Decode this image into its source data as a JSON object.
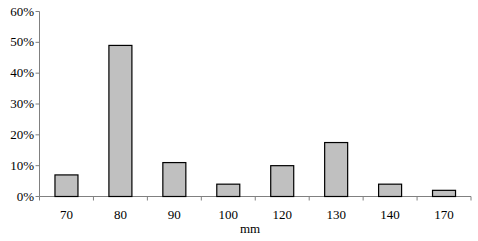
{
  "chart_data": {
    "type": "bar",
    "title": "",
    "xlabel": "mm",
    "ylabel": "",
    "categories": [
      "70",
      "80",
      "90",
      "100",
      "120",
      "130",
      "140",
      "170"
    ],
    "values": [
      7,
      49,
      11,
      4,
      10,
      17.5,
      4,
      2
    ],
    "value_unit": "%",
    "ylim": [
      0,
      60
    ],
    "yticks": [
      "0%",
      "10%",
      "20%",
      "30%",
      "40%",
      "50%",
      "60%"
    ],
    "grid": false,
    "legend": null,
    "bar_fill": "#c0c0c0",
    "bar_stroke": "#000000"
  }
}
